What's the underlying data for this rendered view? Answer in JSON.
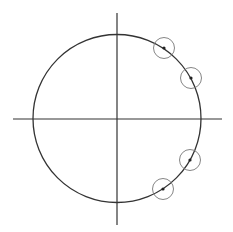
{
  "diagram": {
    "type": "unit-circle-with-marked-points",
    "width": 233,
    "height": 232,
    "colors": {
      "background": "#ffffff",
      "axes": "#333333",
      "main_circle": "#333333",
      "marker_circle": "#777777",
      "point": "#222222"
    },
    "axes": {
      "horizontal": {
        "x1": 13,
        "y1": 119,
        "x2": 222,
        "y2": 119
      },
      "vertical": {
        "x1": 117,
        "y1": 13,
        "x2": 117,
        "y2": 225
      }
    },
    "main_circle": {
      "cx": 117,
      "cy": 118.5,
      "r": 84
    },
    "marked_points": [
      {
        "cx": 164,
        "cy": 48,
        "marker_r": 10.5
      },
      {
        "cx": 191,
        "cy": 78,
        "marker_r": 10.5
      },
      {
        "cx": 190,
        "cy": 160,
        "marker_r": 10.5
      },
      {
        "cx": 163,
        "cy": 189,
        "marker_r": 10.5
      }
    ]
  }
}
